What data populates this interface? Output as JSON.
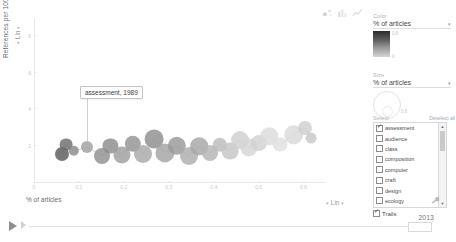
{
  "chart_data": {
    "type": "scatter",
    "title": "",
    "xlabel": "% of articles",
    "ylabel": "References per 1000 words",
    "xticks": [
      "0",
      "0.1",
      "0.2",
      "0.3",
      "0.4",
      "0.5",
      "0.6"
    ],
    "yticks": [
      "8",
      "6",
      "4",
      "2"
    ],
    "xlim": [
      0,
      0.65
    ],
    "ylim": [
      0,
      9
    ],
    "grid": false,
    "x_scale": "Lin",
    "y_scale": "Lin",
    "legend_position": "right-panel",
    "selected_year": "2013",
    "annotation": "assessment, 1989",
    "series": [
      {
        "name": "assessment",
        "trail": true,
        "points": [
          {
            "x": 0.062,
            "y": 1.55,
            "size": 7.0,
            "color": "#5a5a5a",
            "year": "1989"
          },
          {
            "x": 0.072,
            "y": 2.05,
            "size": 6.4,
            "color": "#6d6d6d",
            "year": "1990"
          },
          {
            "x": 0.088,
            "y": 1.7,
            "size": 5.2,
            "color": "#8a8a8a",
            "year": "1991"
          },
          {
            "x": 0.118,
            "y": 1.9,
            "size": 6.0,
            "color": "#a0a0a0",
            "year": "1992"
          },
          {
            "x": 0.152,
            "y": 1.45,
            "size": 8.0,
            "color": "#909090",
            "year": "1993"
          },
          {
            "x": 0.17,
            "y": 2.0,
            "size": 7.6,
            "color": "#8c8c8c",
            "year": "1994"
          },
          {
            "x": 0.196,
            "y": 1.5,
            "size": 8.6,
            "color": "#9d9d9d",
            "year": "1995"
          },
          {
            "x": 0.22,
            "y": 2.1,
            "size": 8.2,
            "color": "#929292",
            "year": "1996"
          },
          {
            "x": 0.243,
            "y": 1.55,
            "size": 9.0,
            "color": "#a8a8a8",
            "year": "1997"
          },
          {
            "x": 0.268,
            "y": 2.35,
            "size": 9.4,
            "color": "#8e8e8e",
            "year": "1998"
          },
          {
            "x": 0.292,
            "y": 1.6,
            "size": 9.6,
            "color": "#a3a3a3",
            "year": "1999"
          },
          {
            "x": 0.318,
            "y": 2.0,
            "size": 9.2,
            "color": "#999999",
            "year": "2000"
          },
          {
            "x": 0.344,
            "y": 1.45,
            "size": 9.0,
            "color": "#adadad",
            "year": "2001"
          },
          {
            "x": 0.368,
            "y": 1.95,
            "size": 8.8,
            "color": "#a6a6a6",
            "year": "2002"
          },
          {
            "x": 0.392,
            "y": 1.6,
            "size": 8.0,
            "color": "#b4b4b4",
            "year": "2003"
          },
          {
            "x": 0.414,
            "y": 2.05,
            "size": 7.2,
            "color": "#bcbcbc",
            "year": "2004"
          },
          {
            "x": 0.436,
            "y": 1.7,
            "size": 8.4,
            "color": "#c6c6c6",
            "year": "2005"
          },
          {
            "x": 0.458,
            "y": 2.3,
            "size": 9.0,
            "color": "#cfcfcf",
            "year": "2006"
          },
          {
            "x": 0.478,
            "y": 1.9,
            "size": 8.6,
            "color": "#d6d6d6",
            "year": "2007"
          },
          {
            "x": 0.5,
            "y": 2.15,
            "size": 8.0,
            "color": "#d2d2d2",
            "year": "2008"
          },
          {
            "x": 0.524,
            "y": 2.5,
            "size": 8.8,
            "color": "#dcdcdc",
            "year": "2009"
          },
          {
            "x": 0.548,
            "y": 2.05,
            "size": 7.4,
            "color": "#e0e0e0",
            "year": "2010"
          },
          {
            "x": 0.578,
            "y": 2.6,
            "size": 9.8,
            "color": "#d9d9d9",
            "year": "2011"
          },
          {
            "x": 0.604,
            "y": 2.95,
            "size": 7.0,
            "color": "#cfcfcf",
            "year": "2012"
          },
          {
            "x": 0.616,
            "y": 2.4,
            "size": 5.4,
            "color": "#c8c8c8",
            "year": "2013"
          }
        ]
      }
    ]
  },
  "chart_type_buttons": [
    {
      "name": "scatter-chart-icon",
      "label": "Bubble chart"
    },
    {
      "name": "bar-chart-icon",
      "label": "Bar chart"
    },
    {
      "name": "line-chart-icon",
      "label": "Line chart"
    }
  ],
  "panel": {
    "color": {
      "label": "Color",
      "value": "% of articles",
      "caret": "▾",
      "scale_ticks": [
        "0.6",
        "0"
      ]
    },
    "size": {
      "label": "Size",
      "value": "% of articles",
      "caret": "▾",
      "tick": "0.6"
    },
    "select": {
      "label": "Select",
      "deselect_all": "Deselect all",
      "items": [
        {
          "label": "assessment",
          "checked": true
        },
        {
          "label": "audience",
          "checked": false
        },
        {
          "label": "class",
          "checked": false
        },
        {
          "label": "composition",
          "checked": false
        },
        {
          "label": "computer",
          "checked": false
        },
        {
          "label": "craft",
          "checked": false
        },
        {
          "label": "design",
          "checked": false
        },
        {
          "label": "ecology",
          "checked": false
        },
        {
          "label": "ethics",
          "checked": false
        }
      ],
      "scroll_up": "▲",
      "scroll_down": "▼"
    },
    "trails": {
      "label": "Trails",
      "checked": true
    },
    "options_icon": "wrench-icon"
  },
  "timeline": {
    "play_label": "Play",
    "step_label": "Step forward",
    "year": "2013",
    "handle_label": "2013"
  }
}
